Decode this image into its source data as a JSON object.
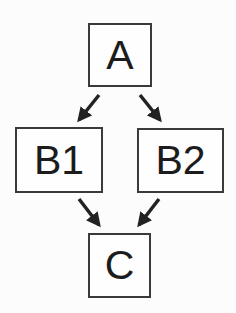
{
  "diagram": {
    "type": "directed-graph",
    "nodes": [
      {
        "id": "A",
        "label": "A"
      },
      {
        "id": "B1",
        "label": "B1"
      },
      {
        "id": "B2",
        "label": "B2"
      },
      {
        "id": "C",
        "label": "C"
      }
    ],
    "edges": [
      {
        "from": "A",
        "to": "B1"
      },
      {
        "from": "A",
        "to": "B2"
      },
      {
        "from": "B1",
        "to": "C"
      },
      {
        "from": "B2",
        "to": "C"
      }
    ],
    "colors": {
      "stroke": "#3a3a3a",
      "text": "#1c1c1c",
      "background": "#fcfcfc"
    }
  }
}
